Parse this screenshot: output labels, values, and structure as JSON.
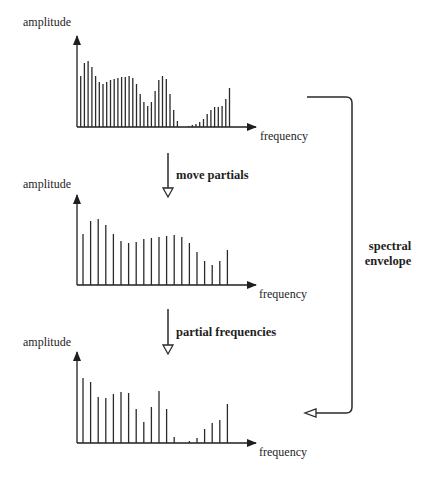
{
  "labels": {
    "amplitude": "amplitude",
    "frequency": "frequency",
    "step1": "move partials",
    "step2": "partial frequencies",
    "envelope_line1": "spectral",
    "envelope_line2": "envelope"
  },
  "colors": {
    "ink": "#1e1e1e",
    "bar": "#2a2a2a",
    "background": "#ffffff"
  },
  "chart_data": [
    {
      "type": "bar",
      "title": "Original spectrum",
      "xlabel": "frequency",
      "ylabel": "amplitude",
      "grid": false,
      "x_start": 80.7,
      "x_step": 3.72,
      "values": [
        51,
        64,
        66,
        60,
        51,
        45,
        43,
        45,
        47,
        48,
        49,
        50,
        50,
        51,
        49,
        43,
        33,
        25,
        21,
        25,
        36,
        47,
        51,
        48,
        33,
        17,
        6,
        0,
        0,
        1,
        2,
        3,
        5,
        8,
        13,
        17,
        20,
        20,
        21,
        28,
        39
      ]
    },
    {
      "type": "bar",
      "title": "Spectral envelope (moved partials)",
      "xlabel": "frequency",
      "ylabel": "amplitude",
      "grid": false,
      "x_start": 83,
      "x_step": 7.6,
      "values": [
        51,
        64,
        66,
        60,
        51,
        44,
        42,
        43,
        46,
        47,
        48,
        49,
        50,
        48,
        42,
        33,
        24,
        20,
        24,
        35
      ]
    },
    {
      "type": "bar",
      "title": "Partial frequencies with spectral envelope",
      "xlabel": "frequency",
      "ylabel": "amplitude",
      "grid": false,
      "x_start": 83,
      "x_step": 7.6,
      "values": [
        65,
        61,
        46,
        45,
        49,
        51,
        50,
        34,
        21,
        36,
        52,
        34,
        6,
        0,
        2,
        5,
        14,
        20,
        23,
        39
      ]
    }
  ]
}
